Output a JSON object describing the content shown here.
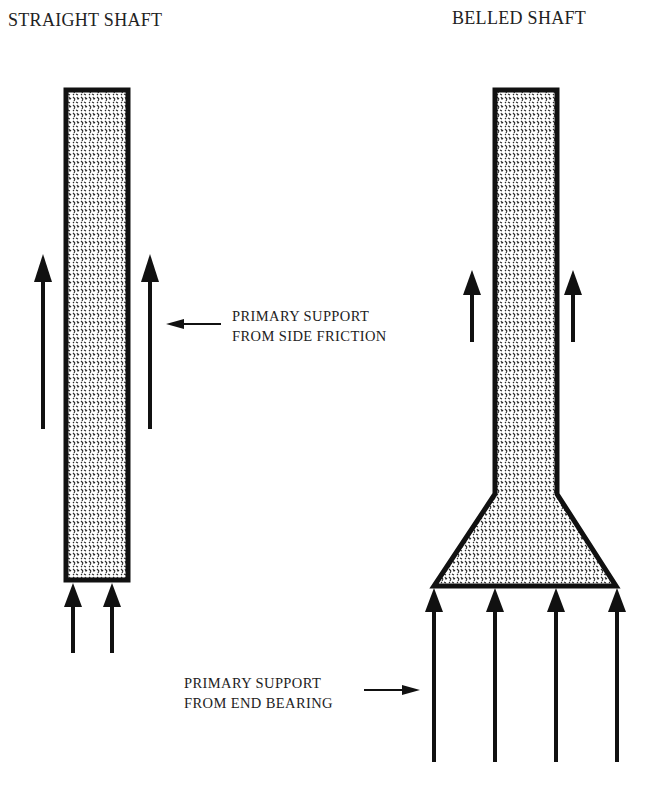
{
  "titles": {
    "straight": "STRAIGHT SHAFT",
    "belled": "BELLED SHAFT"
  },
  "annotations": {
    "side_friction": {
      "line1": "PRIMARY SUPPORT",
      "line2": "FROM SIDE FRICTION"
    },
    "end_bearing": {
      "line1": "PRIMARY SUPPORT",
      "line2": "FROM END BEARING"
    }
  },
  "colors": {
    "outline": "#111111",
    "fill_dots": "#333333",
    "background": "#ffffff"
  }
}
